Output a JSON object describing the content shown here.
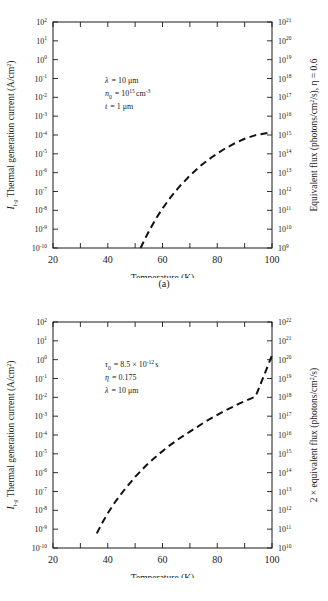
{
  "figure": {
    "panels": [
      {
        "id": "a",
        "caption": "(a)",
        "xaxis": {
          "title": "Temperature (K)",
          "min": 20,
          "max": 100,
          "tick_step": 10,
          "labels": [
            "20",
            "40",
            "60",
            "80",
            "100"
          ],
          "label_values": [
            20,
            40,
            60,
            80,
            100
          ]
        },
        "yaxis_left": {
          "title_prefix": "I",
          "title_sub": "t-g",
          "title": " Thermal generation current (A/cm",
          "title_sup": "2",
          "title_close": ")",
          "base": "10",
          "exponents": [
            2,
            1,
            0,
            -1,
            -2,
            -3,
            -4,
            -5,
            -6,
            -7,
            -8,
            -9,
            -10
          ],
          "min_exp": -10,
          "max_exp": 2
        },
        "yaxis_right": {
          "title": "Equivalent flux (photons/cm",
          "title_sup": "2",
          "title_mid": "/s), η = 0.6",
          "base": "10",
          "exponents": [
            21,
            20,
            19,
            18,
            17,
            16,
            15,
            14,
            13,
            12,
            11,
            10,
            9
          ],
          "min_exp": 9,
          "max_exp": 21
        },
        "annotations": [
          {
            "sym": "λ",
            "sub": "",
            "eq": "= 10 μm",
            "sup": "",
            "tail": ""
          },
          {
            "sym": "n",
            "sub": "0",
            "eq": "= 10",
            "sup": "15",
            "tail": "cm",
            "tail_sup": "-3"
          },
          {
            "sym": "t",
            "sub": "",
            "eq": "= 1 μm",
            "sup": "",
            "tail": ""
          }
        ]
      },
      {
        "id": "b",
        "caption": "(b)",
        "xaxis": {
          "title": "Temperature (K)",
          "min": 20,
          "max": 100,
          "tick_step": 10,
          "labels": [
            "20",
            "40",
            "60",
            "80",
            "100"
          ],
          "label_values": [
            20,
            40,
            60,
            80,
            100
          ]
        },
        "yaxis_left": {
          "title_prefix": "I",
          "title_sub": "t-g",
          "title": " Thermal generation current (A/cm",
          "title_sup": "2",
          "title_close": ")",
          "base": "10",
          "exponents": [
            2,
            1,
            0,
            -1,
            -2,
            -3,
            -4,
            -5,
            -6,
            -7,
            -8,
            -9,
            -10
          ],
          "min_exp": -10,
          "max_exp": 2
        },
        "yaxis_right": {
          "title": "2 × equivalent flux (photons/cm",
          "title_sup": "2",
          "title_mid": "/s)",
          "base": "10",
          "exponents": [
            22,
            21,
            20,
            19,
            18,
            17,
            16,
            15,
            14,
            13,
            12,
            11,
            10
          ],
          "min_exp": 10,
          "max_exp": 22
        },
        "annotations": [
          {
            "sym": "τ",
            "sub": "0",
            "eq": "= 8.5 × 10",
            "sup": "-12",
            "tail": "s"
          },
          {
            "sym": "η",
            "sub": "",
            "eq": "= 0.175",
            "sup": "",
            "tail": ""
          },
          {
            "sym": "λ",
            "sub": "",
            "eq": "= 10 μm",
            "sup": "",
            "tail": ""
          }
        ]
      }
    ]
  },
  "chart_data": [
    {
      "type": "line",
      "title": "(a) Thermal generation current vs temperature",
      "xlabel": "Temperature (K)",
      "ylabel": "I_t-g Thermal generation current (A/cm^2)",
      "y2label": "Equivalent flux (photons/cm^2/s), eta = 0.6",
      "xlim": [
        20,
        100
      ],
      "ylim": [
        1e-10,
        100
      ],
      "y2lim": [
        1000000000.0,
        1e+21
      ],
      "yscale": "log",
      "grid": false,
      "legend": "none",
      "linestyle": "dashed",
      "series": [
        {
          "name": "I_t-g",
          "x": [
            52,
            54,
            56,
            58,
            60,
            63,
            66,
            70,
            74,
            78,
            82,
            86,
            90,
            94,
            100
          ],
          "y": [
            1e-10,
            4e-10,
            1.4e-09,
            4.4e-09,
            1.25e-08,
            5e-08,
            1.7e-07,
            7e-07,
            2.4e-06,
            6.6e-06,
            1.6e-05,
            3.4e-05,
            6.3e-05,
            9.8e-05,
            0.00014
          ]
        }
      ],
      "annotations": [
        "lambda = 10 um",
        "n_0 = 10^15 cm^-3",
        "t = 1 um"
      ]
    },
    {
      "type": "line",
      "title": "(b) Thermal generation current vs temperature",
      "xlabel": "Temperature (K)",
      "ylabel": "I_t-g Thermal generation current (A/cm^2)",
      "y2label": "2 x equivalent flux (photons/cm^2/s)",
      "xlim": [
        20,
        100
      ],
      "ylim": [
        1e-10,
        100
      ],
      "y2lim": [
        10000000000.0,
        1e+22
      ],
      "yscale": "log",
      "grid": false,
      "legend": "none",
      "linestyle": "dashed",
      "series": [
        {
          "name": "I_t-g",
          "x": [
            36,
            38,
            40,
            43,
            46,
            50,
            54,
            58,
            62,
            66,
            70,
            76,
            82,
            88,
            94,
            100
          ],
          "y": [
            6e-10,
            2.2e-09,
            7e-09,
            3.2e-08,
            1.2e-07,
            6e-07,
            2.4e-06,
            8e-06,
            2.4e-05,
            6.3e-05,
            0.00015,
            0.00055,
            0.0017,
            0.0046,
            0.011,
            1.7
          ]
        }
      ],
      "annotations": [
        "tau_0 = 8.5 x 10^-12 s",
        "eta = 0.175",
        "lambda = 10 um"
      ]
    }
  ]
}
